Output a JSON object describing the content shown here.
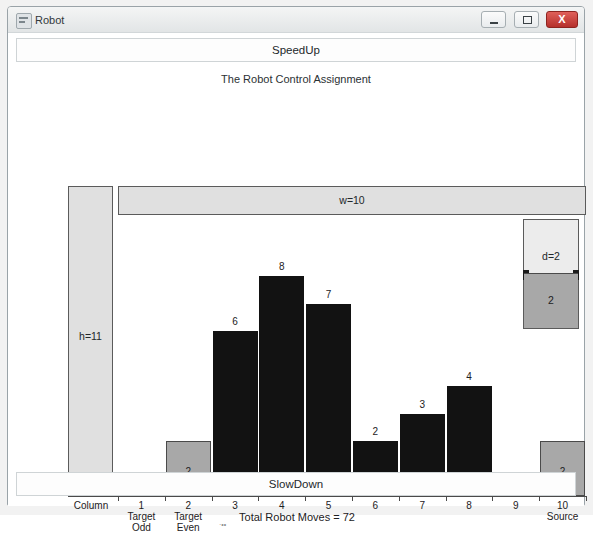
{
  "window": {
    "title": "Robot",
    "icon": "app-icon",
    "buttons": {
      "minimize": "minimize-button",
      "maximize": "maximize-button",
      "close_label": "X"
    }
  },
  "controls": {
    "speedup_label": "SpeedUp",
    "slowdown_label": "SlowDown"
  },
  "chart_title": "The Robot Control Assignment",
  "labels": {
    "height_bar": "h=11",
    "width_bar": "w=10",
    "depth_box": "d=2",
    "depth_fill": "2",
    "column": "Column",
    "total_moves": "Total Robot Moves = 72"
  },
  "chart_data": {
    "type": "bar",
    "title": "The Robot Control Assignment",
    "xlabel": "Column",
    "ylabel": "",
    "ylim": [
      0,
      11
    ],
    "grid": false,
    "legend": "none",
    "categories": [
      "1",
      "2",
      "3",
      "4",
      "5",
      "6",
      "7",
      "8",
      "9",
      "10"
    ],
    "category_sublabels": [
      "Target Odd",
      "Target Even",
      "",
      "",
      "",
      "",
      "",
      "",
      "",
      "Source"
    ],
    "values": [
      0,
      2,
      6,
      8,
      7,
      2,
      3,
      4,
      0,
      2
    ],
    "bar_colors": [
      "none",
      "#a8a8a8",
      "#121212",
      "#121212",
      "#121212",
      "#121212",
      "#121212",
      "#121212",
      "none",
      "#a8a8a8"
    ],
    "annotations": {
      "width": "w=10",
      "height": "h=11",
      "depth": "d=2",
      "total": "Total Robot Moves = 72"
    }
  },
  "axis": {
    "ticks": [
      {
        "label": "1",
        "sub": "Target\nOdd"
      },
      {
        "label": "2",
        "sub": "Target\nEven"
      },
      {
        "label": "3",
        "sub": ""
      },
      {
        "label": "4",
        "sub": ""
      },
      {
        "label": "5",
        "sub": ""
      },
      {
        "label": "6",
        "sub": ""
      },
      {
        "label": "7",
        "sub": ""
      },
      {
        "label": "8",
        "sub": ""
      },
      {
        "label": "9",
        "sub": ""
      },
      {
        "label": "10",
        "sub": "Source"
      }
    ]
  },
  "colors": {
    "bar_dark": "#121212",
    "bar_gray": "#a8a8a8",
    "panel_gray": "#e0e0e0",
    "close_red": "#b5302c"
  }
}
